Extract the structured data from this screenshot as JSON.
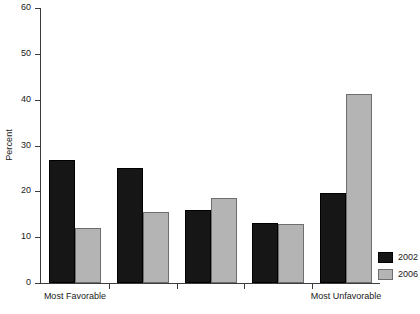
{
  "chart_data": {
    "type": "bar",
    "title": "",
    "subtitle": "",
    "xlabel": "",
    "ylabel": "Percent",
    "ylim": [
      0,
      60
    ],
    "yticks": [
      0,
      10,
      20,
      30,
      40,
      50,
      60
    ],
    "grid": false,
    "legend_position": "bottom-right",
    "categories": [
      "1",
      "2",
      "3",
      "4",
      "5"
    ],
    "category_axis_annotations": [
      {
        "text": "Most Favorable",
        "at_category": "1"
      },
      {
        "text": "Most Unfavorable",
        "at_category": "5"
      }
    ],
    "series": [
      {
        "name": "2002",
        "color": "#161616",
        "values": [
          26.8,
          25.0,
          16.0,
          13.1,
          19.7
        ]
      },
      {
        "name": "2006",
        "color": "#b4b4b4",
        "values": [
          12.1,
          15.6,
          18.5,
          12.8,
          41.3
        ]
      }
    ]
  }
}
